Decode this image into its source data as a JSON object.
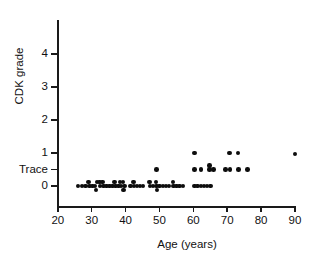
{
  "chart_data": {
    "type": "scatter",
    "title": "",
    "xlabel": "Age (years)",
    "ylabel": "CDK grade",
    "xlim": [
      20,
      90
    ],
    "ylim": [
      -0.5,
      4
    ],
    "grid": false,
    "legend": "none",
    "x_ticks": [
      20,
      30,
      40,
      50,
      60,
      70,
      80,
      90
    ],
    "x_tick_labels": [
      "20",
      "30",
      "40",
      "50",
      "60",
      "70",
      "80",
      "90"
    ],
    "y_ticks": [
      0,
      0.5,
      1,
      2,
      3,
      4
    ],
    "y_tick_labels": [
      "0",
      "Trace",
      "1",
      "2",
      "3",
      "4"
    ],
    "y_category_values": {
      "0": 0,
      "Trace": 0.5,
      "1": 1,
      "2": 2,
      "3": 3,
      "4": 4
    },
    "marker": "filled-circle",
    "marker_color": "#0d0d0d",
    "marker_size_px": 4.6,
    "points": [
      {
        "x": 26.0,
        "y": 0
      },
      {
        "x": 27.2,
        "y": 0
      },
      {
        "x": 28.2,
        "y": 0
      },
      {
        "x": 29.0,
        "y": 0.12
      },
      {
        "x": 29.3,
        "y": 0
      },
      {
        "x": 30.2,
        "y": 0
      },
      {
        "x": 31.0,
        "y": 0
      },
      {
        "x": 31.3,
        "y": -0.12
      },
      {
        "x": 31.6,
        "y": 0.12
      },
      {
        "x": 32.3,
        "y": 0.12
      },
      {
        "x": 32.4,
        "y": 0
      },
      {
        "x": 33.2,
        "y": 0.12
      },
      {
        "x": 33.4,
        "y": 0
      },
      {
        "x": 34.3,
        "y": 0
      },
      {
        "x": 35.2,
        "y": 0
      },
      {
        "x": 36.1,
        "y": 0
      },
      {
        "x": 36.8,
        "y": 0.12
      },
      {
        "x": 37.0,
        "y": 0
      },
      {
        "x": 37.9,
        "y": 0
      },
      {
        "x": 38.4,
        "y": 0.12
      },
      {
        "x": 38.7,
        "y": 0
      },
      {
        "x": 39.2,
        "y": 0.12
      },
      {
        "x": 39.4,
        "y": -0.12
      },
      {
        "x": 39.6,
        "y": 0
      },
      {
        "x": 41.4,
        "y": 0
      },
      {
        "x": 42.3,
        "y": 0.12
      },
      {
        "x": 42.5,
        "y": 0
      },
      {
        "x": 43.4,
        "y": 0
      },
      {
        "x": 44.3,
        "y": 0
      },
      {
        "x": 45.2,
        "y": 0
      },
      {
        "x": 47.0,
        "y": 0.12
      },
      {
        "x": 47.2,
        "y": 0
      },
      {
        "x": 48.1,
        "y": 0
      },
      {
        "x": 49.0,
        "y": 0.12
      },
      {
        "x": 49.2,
        "y": 0
      },
      {
        "x": 49.3,
        "y": -0.12
      },
      {
        "x": 50.1,
        "y": 0
      },
      {
        "x": 51.0,
        "y": 0
      },
      {
        "x": 51.9,
        "y": 0
      },
      {
        "x": 52.8,
        "y": 0
      },
      {
        "x": 54.0,
        "y": 0.12
      },
      {
        "x": 54.2,
        "y": 0
      },
      {
        "x": 55.1,
        "y": 0
      },
      {
        "x": 56.0,
        "y": 0
      },
      {
        "x": 56.9,
        "y": 0
      },
      {
        "x": 60.4,
        "y": 0
      },
      {
        "x": 61.3,
        "y": 0
      },
      {
        "x": 62.2,
        "y": 0
      },
      {
        "x": 63.1,
        "y": 0
      },
      {
        "x": 64.0,
        "y": 0
      },
      {
        "x": 65.0,
        "y": 0
      },
      {
        "x": 49.2,
        "y": 0.5
      },
      {
        "x": 60.3,
        "y": 0.5
      },
      {
        "x": 62.2,
        "y": 0.5
      },
      {
        "x": 64.8,
        "y": 0.5
      },
      {
        "x": 64.8,
        "y": 0.62
      },
      {
        "x": 65.9,
        "y": 0.5
      },
      {
        "x": 69.5,
        "y": 0.5
      },
      {
        "x": 70.8,
        "y": 0.5
      },
      {
        "x": 73.4,
        "y": 0.5
      },
      {
        "x": 76.0,
        "y": 0.5
      },
      {
        "x": 60.3,
        "y": 1
      },
      {
        "x": 70.6,
        "y": 1
      },
      {
        "x": 73.2,
        "y": 1
      },
      {
        "x": 90.0,
        "y": 0.97
      }
    ]
  }
}
